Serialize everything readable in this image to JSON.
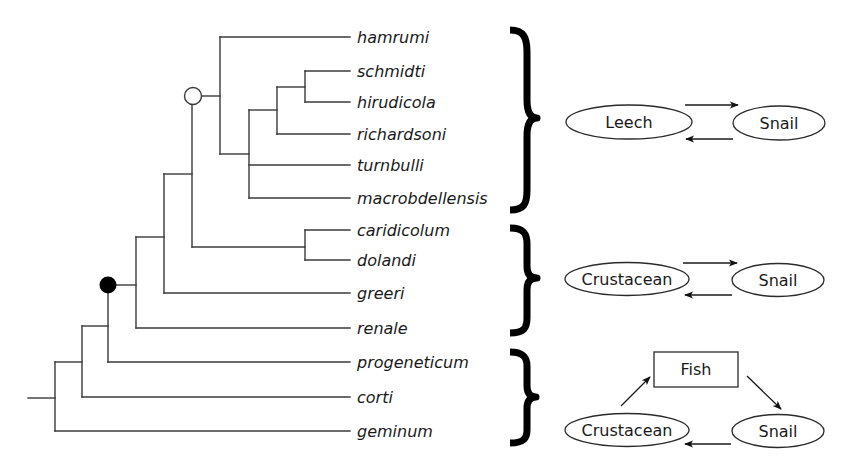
{
  "figure": {
    "type": "phylogenetic-tree-with-life-cycles",
    "line_color": "#3a3a3a",
    "node_markers": [
      {
        "id": "open-node",
        "style": "open-circle",
        "label": "clade of leech-snail life cycle"
      },
      {
        "id": "filled-node",
        "style": "filled-circle",
        "label": "clade of two-host life cycles"
      }
    ]
  },
  "taxa": [
    {
      "name": "hamrumi"
    },
    {
      "name": "schmidti"
    },
    {
      "name": "hirudicola"
    },
    {
      "name": "richardsoni"
    },
    {
      "name": "turnbulli"
    },
    {
      "name": "macrobdellensis"
    },
    {
      "name": "caridicolum"
    },
    {
      "name": "dolandi"
    },
    {
      "name": "greeri"
    },
    {
      "name": "renale"
    },
    {
      "name": "progeneticum"
    },
    {
      "name": "corti"
    },
    {
      "name": "geminum"
    }
  ],
  "groups": [
    {
      "name": "leech-group",
      "members": [
        "hamrumi",
        "schmidti",
        "hirudicola",
        "richardsoni",
        "turnbulli",
        "macrobdellensis"
      ],
      "life_cycle": {
        "hosts": [
          "Leech",
          "Snail"
        ],
        "arrows": [
          "Leech → Snail",
          "Snail → Leech"
        ]
      }
    },
    {
      "name": "crustacean-group",
      "members": [
        "caridicolum",
        "dolandi",
        "greeri",
        "renale"
      ],
      "life_cycle": {
        "hosts": [
          "Crustacean",
          "Snail"
        ],
        "arrows": [
          "Crustacean → Snail",
          "Snail → Crustacean"
        ]
      }
    },
    {
      "name": "fish-group",
      "members": [
        "progeneticum",
        "corti",
        "geminum"
      ],
      "life_cycle": {
        "hosts": [
          "Fish",
          "Crustacean",
          "Snail"
        ],
        "arrows": [
          "Crustacean → Fish",
          "Fish → Snail",
          "Snail → Crustacean"
        ]
      }
    }
  ],
  "cycle1": {
    "host_a": "Leech",
    "host_b": "Snail"
  },
  "cycle2": {
    "host_a": "Crustacean",
    "host_b": "Snail"
  },
  "cycle3": {
    "host_top": "Fish",
    "host_a": "Crustacean",
    "host_b": "Snail"
  }
}
